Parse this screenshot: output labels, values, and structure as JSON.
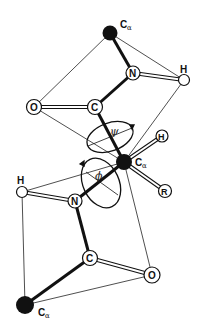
{
  "diagram": {
    "atoms": {
      "ca_top": {
        "label": "C",
        "sub": "α"
      },
      "n_top": {
        "label": "N"
      },
      "h_top": {
        "label": "H"
      },
      "o_top": {
        "label": "O"
      },
      "c_top": {
        "label": "C"
      },
      "ca_mid": {
        "label": "C",
        "sub": "α"
      },
      "h_mid": {
        "label": "H"
      },
      "r_mid": {
        "label": "R"
      },
      "h_bot": {
        "label": "H"
      },
      "n_bot": {
        "label": "N"
      },
      "c_bot": {
        "label": "C"
      },
      "o_bot": {
        "label": "O"
      },
      "ca_bot": {
        "label": "C",
        "sub": "α"
      }
    },
    "angles": {
      "psi": "ψ",
      "phi": "ϕ"
    },
    "colors": {
      "bond": "#111111",
      "filled_atom": "#111111",
      "open_atom": "#ffffff"
    }
  }
}
